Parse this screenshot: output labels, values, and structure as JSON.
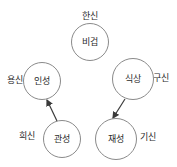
{
  "diagram": {
    "type": "relationship-diagram",
    "background_color": "#ffffff",
    "node_stroke_color": "#8a8a8a",
    "node_fill_color": "#ffffff",
    "text_color": "#2b2b2b",
    "arrow_color": "#3a3a3a",
    "nodes": [
      {
        "id": "bigyeop",
        "label": "비겁",
        "cx": 90,
        "cy": 42,
        "r": 19
      },
      {
        "id": "inseong",
        "label": "인성",
        "cx": 42,
        "cy": 81,
        "r": 19
      },
      {
        "id": "siksang",
        "label": "식상",
        "cx": 133,
        "cy": 79,
        "r": 21
      },
      {
        "id": "gwanseong",
        "label": "관성",
        "cx": 62,
        "cy": 139,
        "r": 19
      },
      {
        "id": "jaeseong",
        "label": "재성",
        "cx": 116,
        "cy": 139,
        "r": 21
      }
    ],
    "side_labels": [
      {
        "id": "hansin",
        "label": "한신",
        "x": 90,
        "y": 16,
        "align": "center"
      },
      {
        "id": "yongsin",
        "label": "용신",
        "x": 15,
        "y": 80,
        "align": "center"
      },
      {
        "id": "gusin",
        "label": "구신",
        "x": 161,
        "y": 78,
        "align": "center"
      },
      {
        "id": "huisin",
        "label": "희신",
        "x": 27,
        "y": 136,
        "align": "center"
      },
      {
        "id": "gisin",
        "label": "기신",
        "x": 148,
        "y": 137,
        "align": "center"
      }
    ],
    "arrows": [
      {
        "id": "gwanseong-to-inseong",
        "from": "gwanseong",
        "to": "inseong",
        "x1": 57,
        "y1": 121,
        "x2": 47,
        "y2": 100
      },
      {
        "id": "siksang-to-jaeseong",
        "from": "siksang",
        "to": "jaeseong",
        "x1": 125,
        "y1": 99,
        "x2": 113,
        "y2": 118
      }
    ]
  }
}
